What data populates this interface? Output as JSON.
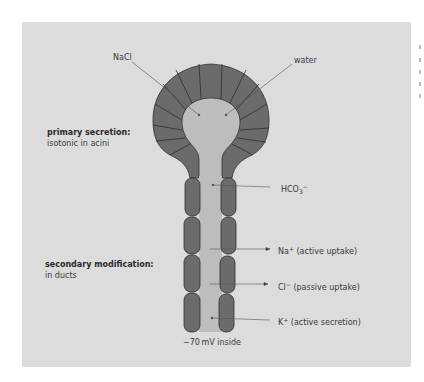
{
  "figure": {
    "panel_color": "#dcdcdc",
    "cell_color": "#6b6b6b",
    "lumen_color": "#bdbdbd",
    "outline_color": "#2e2e2e"
  },
  "labels": {
    "nacl": "NaCl",
    "water": "water",
    "primary_title": "primary secretion:",
    "primary_desc": "isotonic in acini",
    "secondary_title": "secondary modification:",
    "secondary_desc": "in ducts",
    "hco3_base": "HCO",
    "hco3_sub": "3",
    "hco3_sup": "−",
    "na_base": "Na",
    "na_sup": "+",
    "na_desc": " (active uptake)",
    "cl_base": "Cl",
    "cl_sup": "−",
    "cl_desc": " (passive uptake)",
    "k_base": "K",
    "k_sup": "+",
    "k_desc": " (active secretion)",
    "potential": "−70 mV inside"
  }
}
